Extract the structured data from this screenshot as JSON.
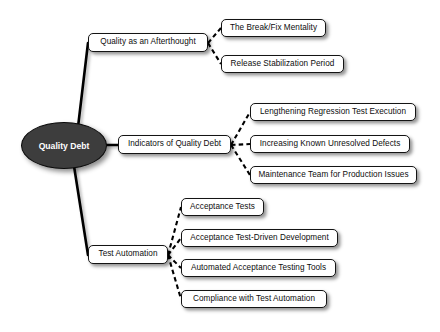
{
  "diagram": {
    "background_color": "#ffffff",
    "root_fill_color": "#3d3d3d",
    "root_text_color": "#ffffff",
    "node_fill_color": "#ffffff",
    "node_border_color": "#141414",
    "edge_color": "#000000"
  },
  "root": {
    "label": "Quality Debt",
    "x": 21,
    "y": 122,
    "w": 86,
    "h": 47
  },
  "branches": [
    {
      "id": "afterthought",
      "label": "Quality as an Afterthought",
      "x": 88,
      "y": 33,
      "w": 120,
      "h": 19,
      "children": [
        {
          "label": "The Break/Fix Mentality",
          "x": 221,
          "y": 19,
          "w": 105,
          "h": 18
        },
        {
          "label": "Release Stabilization Period",
          "x": 221,
          "y": 55,
          "w": 123,
          "h": 18
        }
      ]
    },
    {
      "id": "indicators",
      "label": "Indicators of Quality Debt",
      "x": 118,
      "y": 135,
      "w": 113,
      "h": 19,
      "children": [
        {
          "label": "Lengthening Regression Test Execution",
          "x": 250,
          "y": 103,
          "w": 166,
          "h": 18
        },
        {
          "label": "Increasing Known Unresolved Defects",
          "x": 250,
          "y": 135,
          "w": 160,
          "h": 18
        },
        {
          "label": "Maintenance Team for Production Issues",
          "x": 250,
          "y": 166,
          "w": 167,
          "h": 18
        }
      ]
    },
    {
      "id": "test-automation",
      "label": "Test Automation",
      "x": 88,
      "y": 245,
      "w": 80,
      "h": 19,
      "children": [
        {
          "label": "Acceptance Tests",
          "x": 181,
          "y": 198,
          "w": 83,
          "h": 18
        },
        {
          "label": "Acceptance Test-Driven Development",
          "x": 181,
          "y": 229,
          "w": 157,
          "h": 18
        },
        {
          "label": "Automated Acceptance Testing Tools",
          "x": 181,
          "y": 259,
          "w": 155,
          "h": 18
        },
        {
          "label": "Compliance with Test Automation",
          "x": 181,
          "y": 290,
          "w": 146,
          "h": 18
        }
      ]
    }
  ],
  "chart_data": {
    "type": "diagram",
    "diagram_type": "mind-map",
    "title": "Quality Debt",
    "root": "Quality Debt",
    "edge_styles": {
      "root_to_branch": "solid",
      "branch_to_leaf": "dashed"
    },
    "nodes": [
      {
        "id": "root",
        "label": "Quality Debt",
        "level": 0,
        "shape": "ellipse"
      },
      {
        "id": "b1",
        "label": "Quality as an Afterthought",
        "level": 1,
        "parent": "root",
        "shape": "rounded-rect"
      },
      {
        "id": "b2",
        "label": "Indicators of Quality Debt",
        "level": 1,
        "parent": "root",
        "shape": "rounded-rect"
      },
      {
        "id": "b3",
        "label": "Test Automation",
        "level": 1,
        "parent": "root",
        "shape": "rounded-rect"
      },
      {
        "id": "l1",
        "label": "The Break/Fix Mentality",
        "level": 2,
        "parent": "b1",
        "shape": "rounded-rect"
      },
      {
        "id": "l2",
        "label": "Release Stabilization Period",
        "level": 2,
        "parent": "b1",
        "shape": "rounded-rect"
      },
      {
        "id": "l3",
        "label": "Lengthening Regression Test Execution",
        "level": 2,
        "parent": "b2",
        "shape": "rounded-rect"
      },
      {
        "id": "l4",
        "label": "Increasing Known Unresolved Defects",
        "level": 2,
        "parent": "b2",
        "shape": "rounded-rect"
      },
      {
        "id": "l5",
        "label": "Maintenance Team for Production Issues",
        "level": 2,
        "parent": "b2",
        "shape": "rounded-rect"
      },
      {
        "id": "l6",
        "label": "Acceptance Tests",
        "level": 2,
        "parent": "b3",
        "shape": "rounded-rect"
      },
      {
        "id": "l7",
        "label": "Acceptance Test-Driven Development",
        "level": 2,
        "parent": "b3",
        "shape": "rounded-rect"
      },
      {
        "id": "l8",
        "label": "Automated Acceptance Testing Tools",
        "level": 2,
        "parent": "b3",
        "shape": "rounded-rect"
      },
      {
        "id": "l9",
        "label": "Compliance with Test Automation",
        "level": 2,
        "parent": "b3",
        "shape": "rounded-rect"
      }
    ]
  }
}
